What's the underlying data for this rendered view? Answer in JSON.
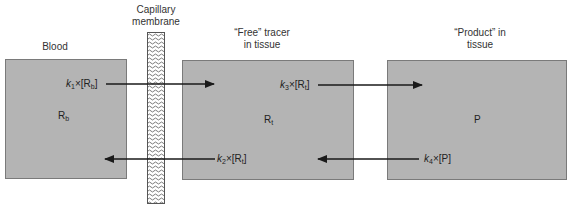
{
  "headings": {
    "blood": "Blood",
    "membrane_line1": "Capillary",
    "membrane_line2": "membrane",
    "free_line1": "“Free” tracer",
    "free_line2": "in tissue",
    "product_line1": "“Product” in",
    "product_line2": "tissue"
  },
  "compartments": [
    {
      "id": "blood",
      "var_main": "R",
      "var_sub": "b"
    },
    {
      "id": "free",
      "var_main": "R",
      "var_sub": "t"
    },
    {
      "id": "product",
      "var_main": "P",
      "var_sub": ""
    }
  ],
  "rates": {
    "k1": {
      "k": "k",
      "ksub": "1",
      "times": "×[",
      "main": "R",
      "sub": "b",
      "close": "]"
    },
    "k2": {
      "k": "k",
      "ksub": "2",
      "times": "×[",
      "main": "R",
      "sub": "t",
      "close": "]"
    },
    "k3": {
      "k": "k",
      "ksub": "3",
      "times": "×[",
      "main": "R",
      "sub": "t",
      "close": "]"
    },
    "k4": {
      "k": "k",
      "ksub": "4",
      "times": "×[",
      "main": "P",
      "sub": "",
      "close": "]"
    }
  },
  "colors": {
    "box_fill": "#b4b4b4",
    "box_border": "#7a7a7a",
    "arrow": "#1a1a1a"
  }
}
